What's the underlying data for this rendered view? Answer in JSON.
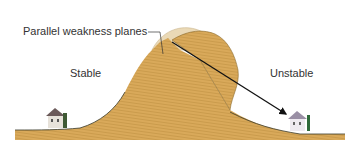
{
  "diagram": {
    "labels": {
      "weakness_planes": "Parallel weakness planes",
      "stable": "Stable",
      "unstable": "Unstable"
    },
    "elements": {
      "hill": "stratified-hillside",
      "slide_block": "displaced-slide-mass",
      "original_position": "pre-slide-outline",
      "arrow": "slide-direction-arrow",
      "house_left": "house-on-stable-side",
      "house_right": "house-on-unstable-side"
    },
    "colors": {
      "terrain": "#D9A95A",
      "terrain_dark": "#B98A3E",
      "terrain_stripe": "#C79848",
      "ghost": "#EAD9B6",
      "ground_line": "#3A3A2A",
      "arrow": "#111111",
      "background": "#FFFFFF"
    }
  }
}
